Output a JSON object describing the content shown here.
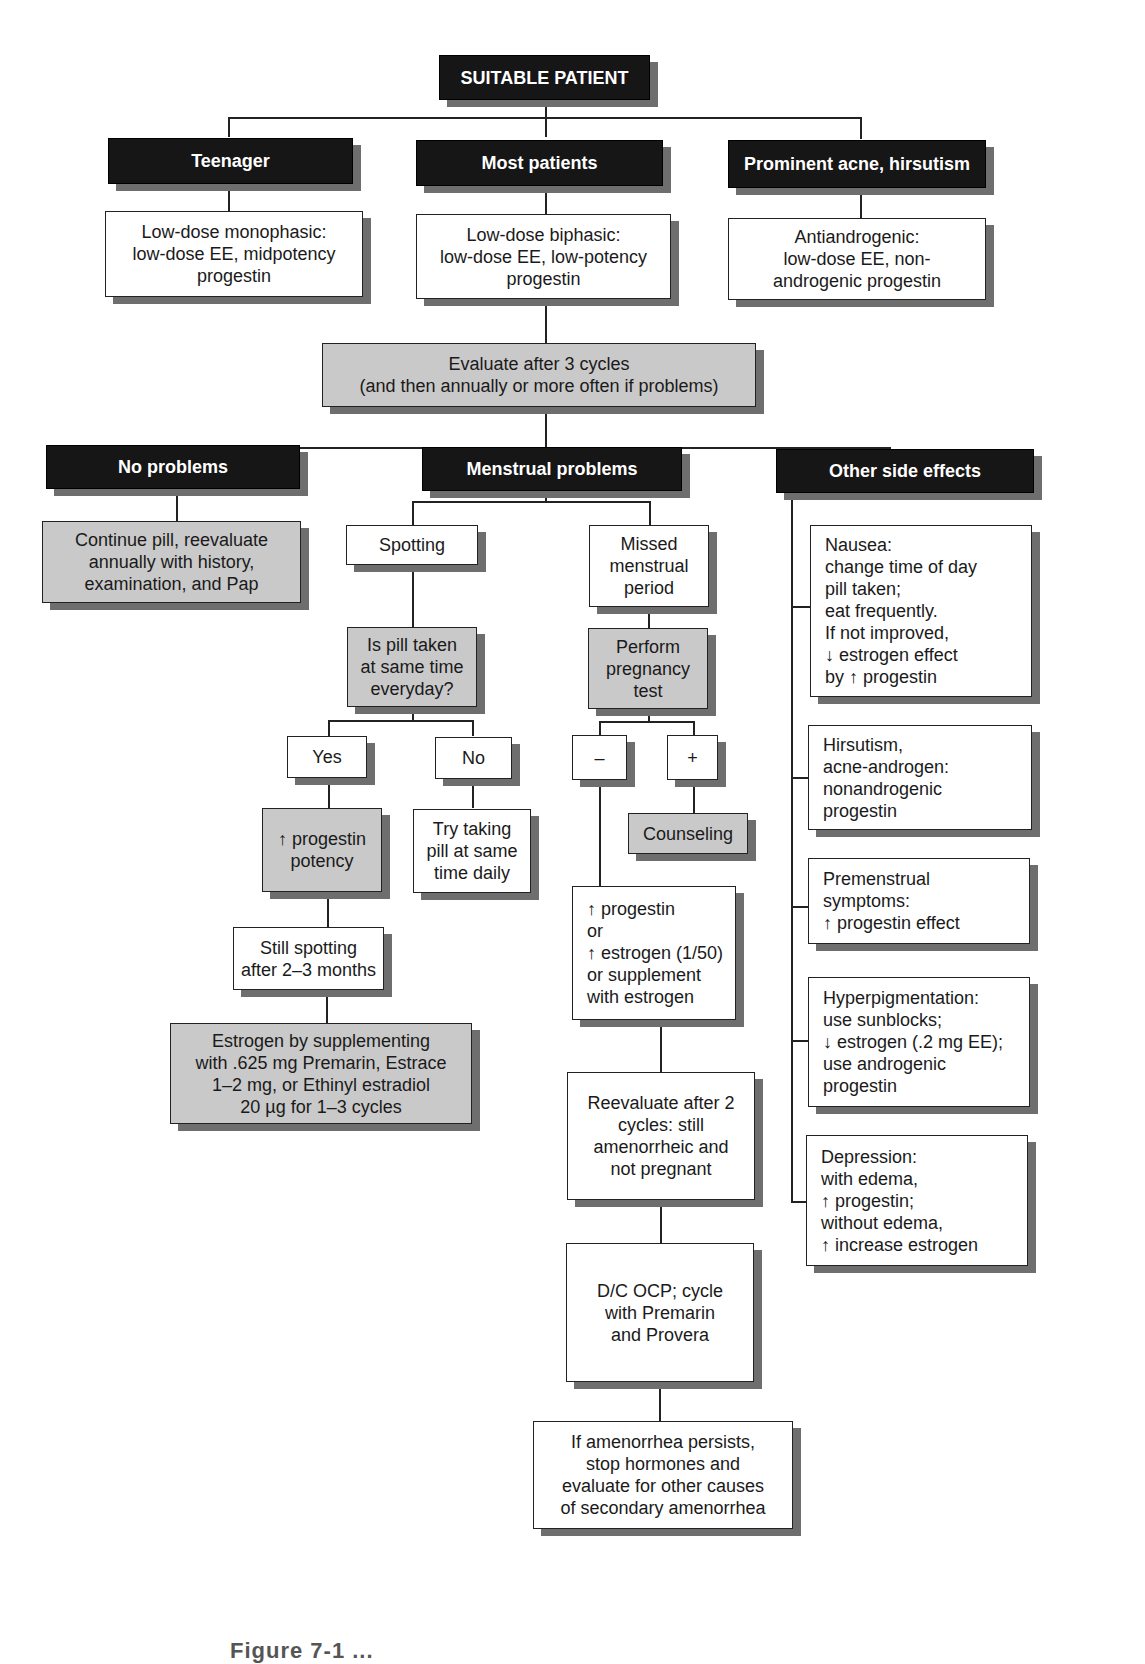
{
  "root": {
    "label": "SUITABLE PATIENT"
  },
  "groups": [
    {
      "header": "Teenager",
      "recommendation": "Low-dose monophasic:\nlow-dose EE, midpotency\nprogestin"
    },
    {
      "header": "Most patients",
      "recommendation": "Low-dose biphasic:\nlow-dose EE, low-potency\nprogestin"
    },
    {
      "header": "Prominent acne, hirsutism",
      "recommendation": "Antiandrogenic:\nlow-dose EE, non-\nandrogenic progestin"
    }
  ],
  "evaluate": {
    "label": "Evaluate after 3 cycles\n(and then annually or more often if problems)"
  },
  "outcomes": {
    "no_problems": {
      "header": "No problems",
      "action": "Continue pill, reevaluate\nannually with history,\nexamination, and Pap"
    },
    "menstrual": {
      "header": "Menstrual problems",
      "spotting": {
        "label": "Spotting",
        "question": "Is pill taken\nat same time\neveryday?",
        "yes": "Yes",
        "no": "No",
        "yes_action": "↑ progestin\npotency",
        "no_action": "Try taking\npill at same\ntime daily",
        "still": "Still spotting\nafter 2–3 months",
        "estrogen": "Estrogen by supplementing\nwith .625 mg Premarin, Estrace\n1–2 mg, or Ethinyl estradiol\n20 µg for 1–3 cycles"
      },
      "missed": {
        "label": "Missed\nmenstrual\nperiod",
        "test": "Perform\npregnancy\ntest",
        "negative": "–",
        "positive": "+",
        "counseling": "Counseling",
        "adjust": "↑ progestin\n   or\n↑ estrogen (1/50)\nor supplement\nwith estrogen",
        "reevaluate": "Reevaluate after 2\ncycles: still\namenorrheic and\nnot pregnant",
        "dc": "D/C OCP; cycle\nwith Premarin\nand Provera",
        "persist": "If amenorrhea persists,\nstop hormones and\nevaluate for other causes\nof secondary amenorrhea"
      }
    },
    "other": {
      "header": "Other side effects",
      "items": [
        "Nausea:\nchange time of day\npill taken;\neat frequently.\nIf not improved,\n↓ estrogen effect\nby ↑ progestin",
        "Hirsutism,\nacne-androgen:\nnonandrogenic\nprogestin",
        "Premenstrual\nsymptoms:\n↑ progestin effect",
        "Hyperpigmentation:\nuse sunblocks;\n↓ estrogen (.2 mg EE);\nuse androgenic\nprogestin",
        "Depression:\nwith edema,\n↑ progestin;\nwithout edema,\n↑ increase estrogen"
      ]
    }
  },
  "caption": {
    "label": "Figure 7-1 ..."
  }
}
